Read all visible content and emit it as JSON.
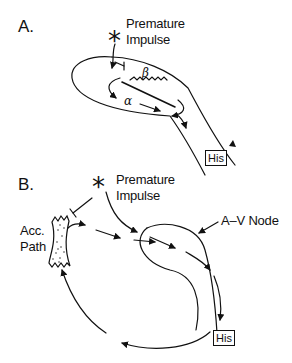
{
  "panels": [
    {
      "id": "A",
      "label": "A.",
      "impulse_line1": "Premature",
      "impulse_line2": "Impulse",
      "star": "*",
      "beta": "β",
      "alpha": "α",
      "his": "His"
    },
    {
      "id": "B",
      "label": "B.",
      "impulse_line1": "Premature",
      "impulse_line2": "Impulse",
      "star": "*",
      "acc_line1": "Acc.",
      "acc_line2": "Path",
      "av_node": "A–V Node",
      "his": "His"
    }
  ],
  "colors": {
    "ink": "#111111",
    "background": "#ffffff"
  }
}
